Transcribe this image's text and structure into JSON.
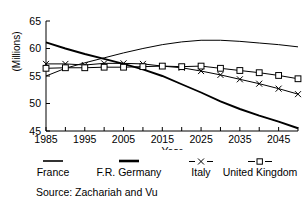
{
  "axes": {
    "ylabel": "(Millions)",
    "xlabel": "Year",
    "yticks": [
      "45",
      "50",
      "55",
      "60",
      "65"
    ],
    "xticks": [
      "1985",
      "1995",
      "2005",
      "2015",
      "2025",
      "2035",
      "2045"
    ]
  },
  "legend": {
    "items": [
      {
        "label": "France",
        "key": "solid-thin-line",
        "color": "#000000"
      },
      {
        "label": "F.R. Germany",
        "key": "solid-thick-line",
        "color": "#000000"
      },
      {
        "label": "Italy",
        "key": "dashed-x-marker",
        "color": "#000000"
      },
      {
        "label": "United Kingdom",
        "key": "dashed-square-marker",
        "color": "#000000"
      }
    ]
  },
  "source": "Source: Zachariah and Vu",
  "chart_data": {
    "type": "line",
    "title": "",
    "xlabel": "Year",
    "ylabel": "(Millions)",
    "xlim": [
      1985,
      2050
    ],
    "ylim": [
      45,
      65
    ],
    "xticks": [
      1985,
      1990,
      1995,
      2000,
      2005,
      2010,
      2015,
      2020,
      2025,
      2030,
      2035,
      2040,
      2045,
      2050
    ],
    "xtick_labels": [
      1985,
      1995,
      2005,
      2015,
      2025,
      2035,
      2045
    ],
    "yticks": [
      45,
      50,
      55,
      60,
      65
    ],
    "grid": false,
    "legend_position": "below",
    "x": [
      1985,
      1990,
      1995,
      2000,
      2005,
      2010,
      2015,
      2020,
      2025,
      2030,
      2035,
      2040,
      2045,
      2050
    ],
    "series": [
      {
        "name": "France",
        "marker": "none",
        "linestyle": "solid",
        "linewidth": "thin",
        "values": [
          55.0,
          56.4,
          57.4,
          58.3,
          59.2,
          60.0,
          60.7,
          61.2,
          61.5,
          61.5,
          61.3,
          61.0,
          60.7,
          60.3
        ]
      },
      {
        "name": "F.R. Germany",
        "marker": "none",
        "linestyle": "solid",
        "linewidth": "thick",
        "values": [
          61.1,
          60.0,
          59.0,
          58.1,
          57.2,
          56.2,
          55.0,
          53.5,
          52.0,
          50.4,
          49.0,
          47.8,
          46.7,
          45.5
        ]
      },
      {
        "name": "Italy",
        "marker": "x",
        "linestyle": "dashed",
        "linewidth": "thin",
        "values": [
          57.2,
          57.2,
          57.0,
          57.3,
          57.3,
          57.2,
          56.8,
          56.5,
          55.9,
          55.2,
          54.4,
          53.6,
          52.7,
          51.7
        ]
      },
      {
        "name": "United Kingdom",
        "marker": "square",
        "linestyle": "dashed",
        "linewidth": "thin",
        "values": [
          56.4,
          56.5,
          56.5,
          56.6,
          56.6,
          56.7,
          56.8,
          56.7,
          56.8,
          56.4,
          56.0,
          55.6,
          55.1,
          54.5
        ]
      }
    ]
  }
}
